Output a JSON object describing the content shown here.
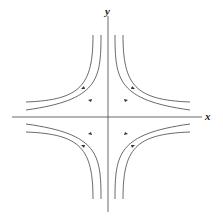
{
  "diagram": {
    "title": "",
    "type": "phase-portrait-saddle",
    "axes": {
      "x_label": "x",
      "y_label": "y"
    },
    "curves": [
      {
        "quadrant": "I",
        "level": "inner"
      },
      {
        "quadrant": "I",
        "level": "outer"
      },
      {
        "quadrant": "II",
        "level": "inner"
      },
      {
        "quadrant": "II",
        "level": "outer"
      },
      {
        "quadrant": "III",
        "level": "inner"
      },
      {
        "quadrant": "III",
        "level": "outer"
      },
      {
        "quadrant": "IV",
        "level": "inner"
      },
      {
        "quadrant": "IV",
        "level": "outer"
      }
    ],
    "colors": {
      "line": "#444444",
      "background": "#ffffff"
    }
  }
}
